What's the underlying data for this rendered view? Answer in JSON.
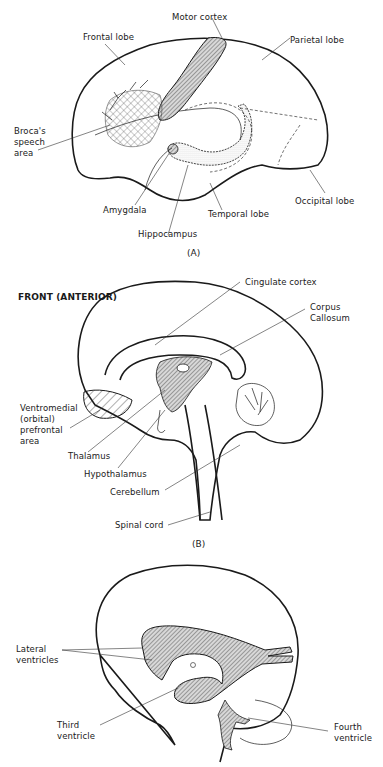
{
  "figure": {
    "panel_a": {
      "caption": "(A)",
      "labels": {
        "motor_cortex": "Motor cortex",
        "frontal_lobe": "Frontal lobe",
        "parietal_lobe": "Parietal lobe",
        "brocas_line1": "Broca's",
        "brocas_line2": "speech",
        "brocas_line3": "area",
        "amygdala": "Amygdala",
        "temporal_lobe": "Temporal lobe",
        "hippocampus": "Hippocampus",
        "occipital_lobe": "Occipital lobe"
      }
    },
    "panel_b": {
      "caption": "(B)",
      "heading": "FRONT (ANTERIOR)",
      "labels": {
        "cingulate_cortex": "Cingulate cortex",
        "corpus_line1": "Corpus",
        "corpus_line2": "Callosum",
        "vmpfc_line1": "Ventromedial",
        "vmpfc_line2": "(orbital)",
        "vmpfc_line3": "prefrontal",
        "vmpfc_line4": "area",
        "thalamus": "Thalamus",
        "hypothalamus": "Hypothalamus",
        "cerebellum": "Cerebellum",
        "spinal_cord": "Spinal cord"
      }
    },
    "panel_c": {
      "labels": {
        "lateral_line1": "Lateral",
        "lateral_line2": "ventricles",
        "third_line1": "Third",
        "third_line2": "ventricle",
        "fourth_line1": "Fourth",
        "fourth_line2": "ventricle"
      }
    }
  }
}
